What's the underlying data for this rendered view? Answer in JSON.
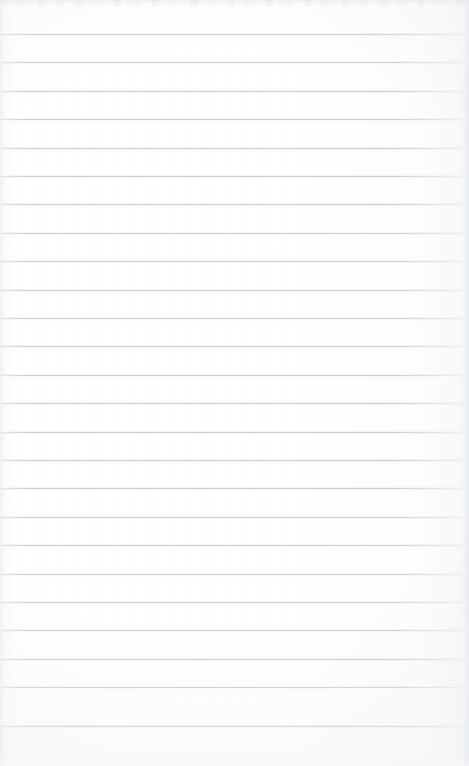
{
  "document": {
    "kind": "scanned-ruled-notebook-page",
    "page_width": 469,
    "page_height": 766,
    "content_text": "",
    "has_handwriting": false,
    "has_printed_text": false,
    "paper_color": "#ffffff",
    "rule_color": "#c9ced3",
    "edge_shadow_color": "#eaecef"
  },
  "ruling": {
    "style": "horizontal-ruled",
    "line_count": 25,
    "first_line_y": 34,
    "line_spacing": 28.4,
    "line_thickness": 1,
    "line_left_x": 0,
    "line_right_x": 465,
    "margin_rule": "none",
    "lines": [
      {
        "index": 1,
        "y": 34,
        "x": 0,
        "width": 465
      },
      {
        "index": 2,
        "y": 62,
        "x": 0,
        "width": 465
      },
      {
        "index": 3,
        "y": 91,
        "x": 0,
        "width": 465
      },
      {
        "index": 4,
        "y": 119,
        "x": 0,
        "width": 465
      },
      {
        "index": 5,
        "y": 148,
        "x": 0,
        "width": 465
      },
      {
        "index": 6,
        "y": 176,
        "x": 0,
        "width": 465
      },
      {
        "index": 7,
        "y": 204,
        "x": 0,
        "width": 465
      },
      {
        "index": 8,
        "y": 233,
        "x": 0,
        "width": 465
      },
      {
        "index": 9,
        "y": 261,
        "x": 0,
        "width": 465
      },
      {
        "index": 10,
        "y": 290,
        "x": 0,
        "width": 465
      },
      {
        "index": 11,
        "y": 318,
        "x": 0,
        "width": 465
      },
      {
        "index": 12,
        "y": 346,
        "x": 0,
        "width": 465
      },
      {
        "index": 13,
        "y": 375,
        "x": 0,
        "width": 465
      },
      {
        "index": 14,
        "y": 403,
        "x": 0,
        "width": 465
      },
      {
        "index": 15,
        "y": 432,
        "x": 0,
        "width": 465
      },
      {
        "index": 16,
        "y": 460,
        "x": 0,
        "width": 465
      },
      {
        "index": 17,
        "y": 488,
        "x": 0,
        "width": 465
      },
      {
        "index": 18,
        "y": 517,
        "x": 0,
        "width": 465
      },
      {
        "index": 19,
        "y": 545,
        "x": 0,
        "width": 465
      },
      {
        "index": 20,
        "y": 574,
        "x": 0,
        "width": 465
      },
      {
        "index": 21,
        "y": 602,
        "x": 0,
        "width": 465
      },
      {
        "index": 22,
        "y": 630,
        "x": 0,
        "width": 465
      },
      {
        "index": 23,
        "y": 659,
        "x": 0,
        "width": 465
      },
      {
        "index": 24,
        "y": 687,
        "x": 0,
        "width": 465
      },
      {
        "index": 25,
        "y": 726,
        "x": 0,
        "width": 465
      }
    ]
  }
}
